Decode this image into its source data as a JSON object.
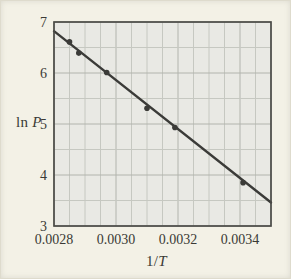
{
  "figure": {
    "background": "#f3f1e6",
    "plot_background": "#e9e9e4",
    "grid_minor_color": "#c6c8c1",
    "grid_major_color": "#b2b4ad",
    "frame_color": "#4b4b47",
    "line_color": "#3b3b38",
    "point_color": "#3b3b38",
    "text_color": "#3a3a35"
  },
  "chart_data": {
    "type": "scatter",
    "title": "",
    "xlabel": "1/T",
    "ylabel": "ln P",
    "xlabel_prefix": "1/",
    "xlabel_var": "T",
    "ylabel_prefix": "ln ",
    "ylabel_var": "P",
    "xlim": [
      0.0028,
      0.0035
    ],
    "ylim": [
      3,
      7
    ],
    "x_ticks": {
      "values": [
        0.0028,
        0.003,
        0.0032,
        0.0034
      ],
      "labels": [
        "0.0028",
        "0.0030",
        "0.0032",
        "0.0034"
      ]
    },
    "y_ticks": {
      "values": [
        3,
        4,
        5,
        6,
        7
      ],
      "labels": [
        "3",
        "4",
        "5",
        "6",
        "7"
      ]
    },
    "grid": {
      "visible": true,
      "x_minor_step": 5e-05,
      "y_minor_step": 0.5
    },
    "points": [
      [
        0.00285,
        6.61
      ],
      [
        0.00288,
        6.39
      ],
      [
        0.00297,
        6.01
      ],
      [
        0.0031,
        5.31
      ],
      [
        0.00319,
        4.93
      ],
      [
        0.00341,
        3.85
      ]
    ],
    "fit_line": {
      "x1": 0.0028,
      "y1": 6.82,
      "x2": 0.0035,
      "y2": 3.46
    },
    "legend_position": "none"
  }
}
